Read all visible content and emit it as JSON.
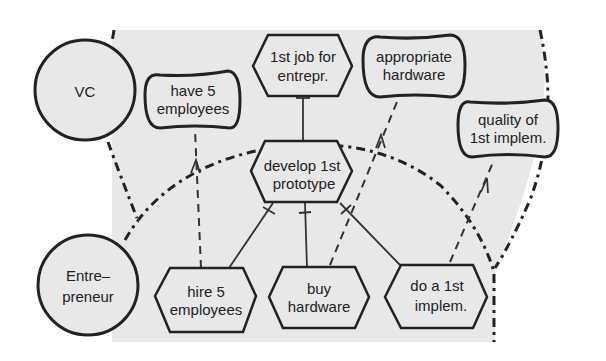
{
  "diagram": {
    "type": "i* strategic rationale / dependency model",
    "colors": {
      "background": "#ffffff",
      "boundary_fill": "#e8e8e8",
      "stroke": "#222222"
    },
    "actors": [
      {
        "id": "vc",
        "label_lines": [
          "VC"
        ]
      },
      {
        "id": "entrepreneur",
        "label_lines": [
          "Entre–",
          "preneur"
        ]
      }
    ],
    "softgoals": [
      {
        "id": "have-5-employees",
        "label_lines": [
          "have 5",
          "employees"
        ]
      },
      {
        "id": "appropriate-hardware",
        "label_lines": [
          "appropriate",
          "hardware"
        ]
      },
      {
        "id": "quality-1st-implem",
        "label_lines": [
          "quality of",
          "1st implem."
        ]
      }
    ],
    "tasks": [
      {
        "id": "1st-job-for-entrepr",
        "label_lines": [
          "1st job for",
          "entrepr."
        ]
      },
      {
        "id": "develop-1st-prototype",
        "label_lines": [
          "develop 1st",
          "prototype"
        ]
      },
      {
        "id": "hire-5-employees",
        "label_lines": [
          "hire 5",
          "employees"
        ]
      },
      {
        "id": "buy-hardware",
        "label_lines": [
          "buy",
          "hardware"
        ]
      },
      {
        "id": "do-a-1st-implem",
        "label_lines": [
          "do a 1st",
          "implem."
        ]
      }
    ],
    "links": [
      {
        "from": "develop-1st-prototype",
        "to": "1st-job-for-entrepr",
        "type": "decomposition"
      },
      {
        "from": "hire-5-employees",
        "to": "develop-1st-prototype",
        "type": "decomposition"
      },
      {
        "from": "buy-hardware",
        "to": "develop-1st-prototype",
        "type": "decomposition"
      },
      {
        "from": "do-a-1st-implem",
        "to": "develop-1st-prototype",
        "type": "decomposition"
      },
      {
        "from": "hire-5-employees",
        "to": "have-5-employees",
        "type": "contribution"
      },
      {
        "from": "buy-hardware",
        "to": "appropriate-hardware",
        "type": "contribution"
      },
      {
        "from": "do-a-1st-implem",
        "to": "quality-1st-implem",
        "type": "contribution"
      }
    ]
  }
}
